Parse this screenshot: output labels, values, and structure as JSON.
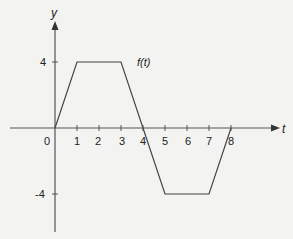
{
  "chart_data": {
    "type": "line",
    "title": "",
    "xlabel": "t",
    "ylabel": "y",
    "series": [
      {
        "name": "f(t)",
        "x": [
          0,
          1,
          3,
          4,
          5,
          7,
          8
        ],
        "values": [
          0,
          4,
          4,
          0,
          -4,
          -4,
          0
        ]
      }
    ],
    "x_ticks": [
      "1",
      "2",
      "3",
      "4",
      "5",
      "6",
      "7",
      "8"
    ],
    "y_ticks": [
      "4",
      "-4"
    ],
    "origin_label": "0",
    "series_label": "f(t)",
    "xlim": [
      -2.3,
      9.8
    ],
    "ylim": [
      -6.3,
      6.3
    ],
    "grid": false,
    "legend_position": "inline-label"
  }
}
